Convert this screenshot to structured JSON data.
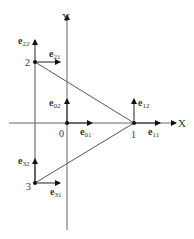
{
  "diagram": {
    "type": "triangle element with nodal unit vectors",
    "axes": {
      "x_label": "X",
      "y_label": "Y",
      "origin_label": "0"
    },
    "nodes": [
      {
        "id": "0",
        "label": "0",
        "vectors": [
          "e01",
          "e02"
        ]
      },
      {
        "id": "1",
        "label": "1",
        "vectors": [
          "e11",
          "e12"
        ]
      },
      {
        "id": "2",
        "label": "2",
        "vectors": [
          "e21",
          "e22"
        ]
      },
      {
        "id": "3",
        "label": "3",
        "vectors": [
          "e31",
          "e32"
        ]
      }
    ],
    "edges": [
      [
        "1",
        "2"
      ],
      [
        "1",
        "3"
      ],
      [
        "2",
        "3"
      ]
    ],
    "vector_labels": {
      "e01": {
        "base": "e",
        "sub": "01"
      },
      "e02": {
        "base": "e",
        "sub": "02"
      },
      "e11": {
        "base": "e",
        "sub": "11"
      },
      "e12": {
        "base": "e",
        "sub": "12"
      },
      "e21": {
        "base": "e",
        "sub": "21"
      },
      "e22": {
        "base": "e",
        "sub": "22"
      },
      "e31": {
        "base": "e",
        "sub": "31"
      },
      "e32": {
        "base": "e",
        "sub": "32"
      }
    },
    "colors": {
      "line": "#555555",
      "text": "#333333",
      "node": "#111111"
    }
  }
}
